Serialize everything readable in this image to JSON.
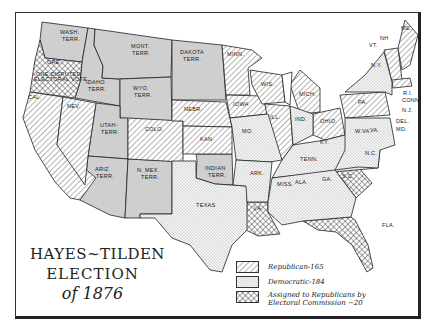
{
  "title": {
    "line1": "HAYES~TILDEN",
    "line2": "ELECTION",
    "line3": "of 1876"
  },
  "legend": [
    {
      "pattern": "hatch",
      "label": "Republican-165"
    },
    {
      "pattern": "dots",
      "label": "Democratic-184"
    },
    {
      "pattern": "crosshatch",
      "label": "Assigned to Republicans by",
      "label2": "Electoral Commission ~20"
    }
  ],
  "colors": {
    "territory": "#cfcfcf",
    "border": "#222222",
    "background": "#ffffff"
  },
  "regions": {
    "republican": [
      "CAL.",
      "NEV.",
      "COLO.",
      "NEBR.",
      "KAN.",
      "MINN.",
      "IOWA",
      "WIS.",
      "MICH.",
      "ILL.",
      "OHIO",
      "PA.",
      "N.Y.? (no)",
      "VT.",
      "N.H.",
      "ME.",
      "MASS.",
      "R.I."
    ],
    "democratic": [
      "TEXAS",
      "MO.",
      "ARK.",
      "KY.",
      "TENN.",
      "MISS.",
      "ALA.",
      "GA.",
      "N.C.",
      "VA.",
      "W.VA.",
      "IND.",
      "N.Y.",
      "N.J.",
      "DEL.",
      "MD.",
      "CONN"
    ],
    "commission": [
      "ORE. (one disputed electoral vote)",
      "LA.",
      "S.C.",
      "FLA."
    ],
    "territories": [
      "WASH. TERR.",
      "IDAHO TERR.",
      "MONT. TERR.",
      "WYO. TERR.",
      "DAKOTA TERR.",
      "UTAH TERR.",
      "ARIZ. TERR.",
      "N. MEX. TERR.",
      "INDIAN TERR."
    ]
  },
  "labels": {
    "wash": [
      "WASH.",
      "TERR."
    ],
    "ore": "ORE.",
    "ore_note": [
      "ONE DISPUTED",
      "ELECTORAL VOTE"
    ],
    "idaho": [
      "IDAHO",
      "TERR."
    ],
    "mont": [
      "MONT.",
      "TERR."
    ],
    "dakota": [
      "DAKOTA",
      "TERR."
    ],
    "wyo": [
      "WYO.",
      "TERR."
    ],
    "cal": "CAL.",
    "nev": "NEV.",
    "utah": [
      "UTAH-",
      "TERR."
    ],
    "colo": "COLO.",
    "nebr": "NEBR.",
    "kan": "KAN.",
    "ariz": [
      "ARIZ.",
      "TERR."
    ],
    "nmex": [
      "N. MEX.",
      "TERR."
    ],
    "indian": [
      "INDIAN",
      "TERR."
    ],
    "texas": "TEXAS",
    "minn": "MINN.",
    "wis": "WIS.",
    "iowa": "IOWA",
    "mo": "MO.",
    "ark": "ARK.",
    "la": "LA.",
    "ill": "ILL.",
    "mich": "MICH.",
    "ind": "IND.",
    "ohio": "OHIO",
    "ky": "KY.",
    "tenn": "TENN.",
    "miss": "MISS.",
    "ala": "ALA.",
    "ga": "GA.",
    "fla": "FLA.",
    "sc": "S.C.",
    "nc": "N.C.",
    "va": "VA.",
    "wva": "W.VA.",
    "pa": "PA.",
    "ny": "N.Y.",
    "vt": "VT.",
    "nh": "NH",
    "me": "ME.",
    "ma": "MA.",
    "ri": "R.I.",
    "conn": "CONN",
    "nj": "N.J.",
    "del": "DEL.",
    "md": "MD."
  }
}
